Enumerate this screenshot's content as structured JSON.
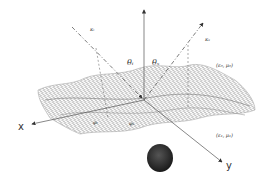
{
  "diagram": {
    "type": "rough-surface scattering geometry",
    "labels": {
      "incident_wave": "κᵢ",
      "scattered_wave": "κₛ",
      "theta_incident": "θᵢ",
      "theta_scattered": "θₛ",
      "phi_incident": "φᵢ",
      "phi_scattered": "φₛ",
      "upper_medium": "(ε₀, μ₀)",
      "lower_medium": "(ε₁, μ₁)",
      "x_axis": "x",
      "y_axis": "y"
    },
    "colors": {
      "mesh": "#9a9a9a",
      "lines": "#555555",
      "object": "#2a2a2a"
    }
  }
}
